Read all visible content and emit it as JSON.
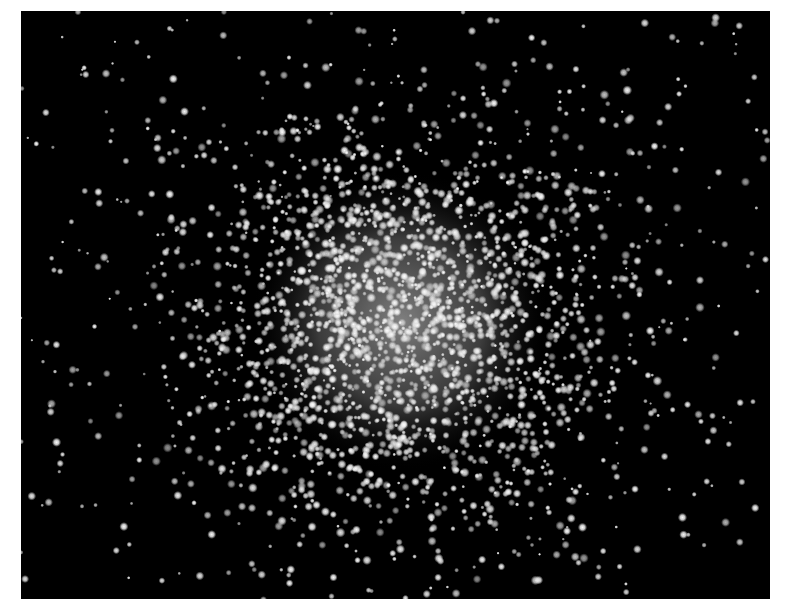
{
  "image": {
    "subject": "globular star cluster",
    "background_color": "#000000",
    "page_color": "#ffffff",
    "frame": {
      "left": 21,
      "top": 11,
      "width": 749,
      "height": 588
    },
    "core": {
      "cx": 380,
      "cy": 310,
      "glow_radius": 150,
      "glow_color": "#8c8c8c"
    },
    "stars": {
      "field_count": 380,
      "cluster_count": 2200,
      "cluster_sigma": 105,
      "seed": 7
    }
  }
}
